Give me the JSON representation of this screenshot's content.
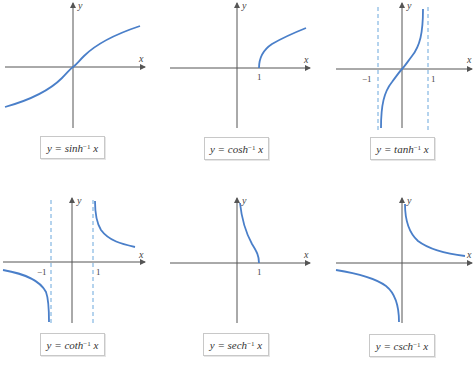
{
  "figure": {
    "panels": [
      {
        "id": "sinh",
        "label_prefix": "y = sinh",
        "exponent": "−1",
        "label_var": "x",
        "x_axis": "x",
        "y_axis": "y",
        "ticks": []
      },
      {
        "id": "cosh",
        "label_prefix": "y = cosh",
        "exponent": "−1",
        "label_var": "x",
        "x_axis": "x",
        "y_axis": "y",
        "ticks": [
          "1"
        ]
      },
      {
        "id": "tanh",
        "label_prefix": "y = tanh",
        "exponent": "−1",
        "label_var": "x",
        "x_axis": "x",
        "y_axis": "y",
        "ticks": [
          "−1",
          "1"
        ]
      },
      {
        "id": "coth",
        "label_prefix": "y = coth",
        "exponent": "−1",
        "label_var": "x",
        "x_axis": "x",
        "y_axis": "y",
        "ticks": [
          "−1",
          "1"
        ]
      },
      {
        "id": "sech",
        "label_prefix": "y = sech",
        "exponent": "−1",
        "label_var": "x",
        "x_axis": "x",
        "y_axis": "y",
        "ticks": [
          "1"
        ]
      },
      {
        "id": "csch",
        "label_prefix": "y = csch",
        "exponent": "−1",
        "label_var": "x",
        "x_axis": "x",
        "y_axis": "y",
        "ticks": []
      }
    ],
    "colors": {
      "curve": "#4a7fc9",
      "asymptote": "#6aa7dc",
      "axis": "#555555"
    }
  }
}
